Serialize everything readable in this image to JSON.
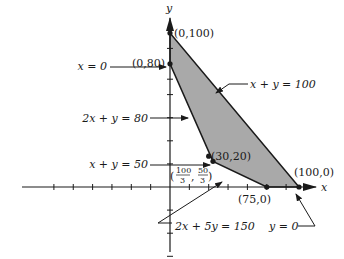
{
  "diagram": {
    "axes": {
      "x_label": "x",
      "y_label": "y"
    },
    "feasible_region": {
      "fill": "#a9a9a9",
      "stroke": "#1a1a1a",
      "vertices": [
        [
          0,
          100
        ],
        [
          0,
          80
        ],
        [
          33.333,
          16.667
        ],
        [
          75,
          0
        ],
        [
          100,
          0
        ]
      ]
    },
    "points": [
      {
        "label": "(0,100)",
        "x": 0,
        "y": 100
      },
      {
        "label": "(0,80)",
        "x": 0,
        "y": 80
      },
      {
        "label": "(30,20)",
        "x": 30,
        "y": 20
      },
      {
        "label_num1": "100",
        "label_den1": "3",
        "label_num2": "50",
        "label_den2": "3",
        "x": 33.333,
        "y": 16.667
      },
      {
        "label": "(75,0)",
        "x": 75,
        "y": 0
      },
      {
        "label": "(100,0)",
        "x": 100,
        "y": 0
      }
    ],
    "constraint_labels": {
      "x0": "x = 0",
      "xy100": "x + y = 100",
      "twoxy80": "2x + y = 80",
      "xy50": "x + y = 50",
      "twox5y150": "2x + 5y = 150",
      "y0": "y = 0"
    },
    "ticks": {
      "x": [
        -90,
        -75,
        -60,
        -45,
        -30,
        -15,
        15,
        30,
        45,
        60,
        75,
        90
      ],
      "y": [
        -45,
        -30,
        -15,
        15,
        30,
        45,
        60,
        70,
        90
      ]
    }
  }
}
